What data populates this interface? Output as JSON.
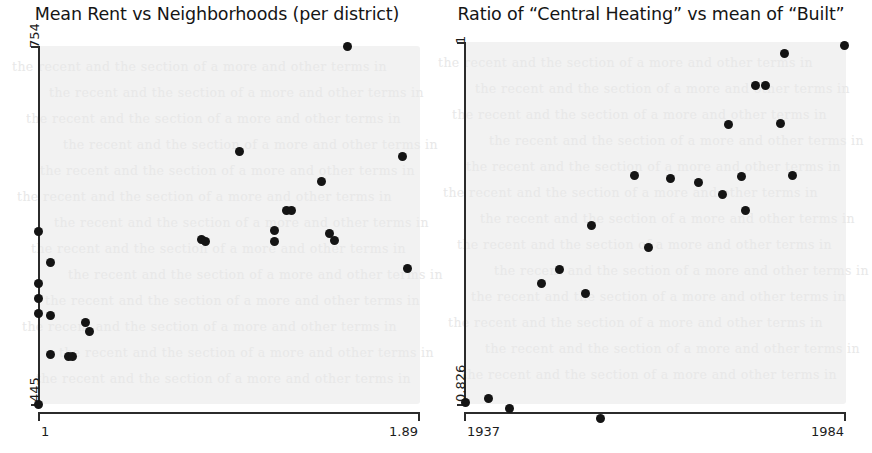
{
  "figure": {
    "background_color": "#ffffff",
    "plot_background_color": "#f2f2f2",
    "marker_color": "#141414",
    "axis_color": "#2b2b2b"
  },
  "panels": [
    {
      "id": "left",
      "title": "Mean Rent vs Neighborhoods (per district)",
      "x_min_label": "1",
      "x_max_label": "1.89",
      "y_min_label": "445",
      "y_max_label": "754"
    },
    {
      "id": "right",
      "title": "Ratio of “Central Heating” vs mean of “Built”",
      "x_min_label": "1937",
      "x_max_label": "1984",
      "y_min_label": "0.826",
      "y_max_label": "1"
    }
  ],
  "chart_data": [
    {
      "type": "scatter",
      "title": "Mean Rent vs Neighborhoods (per district)",
      "xlabel": "Neighborhoods (per district)",
      "ylabel": "Mean Rent",
      "xlim": [
        1,
        1.89
      ],
      "ylim": [
        445,
        754
      ],
      "xticks": [
        1,
        1.89
      ],
      "xticklabels": [
        "1",
        "1.89"
      ],
      "yticks": [
        445,
        754
      ],
      "yticklabels": [
        "445",
        "754"
      ],
      "grid": false,
      "legend": false,
      "points": [
        {
          "x": 1.0,
          "y": 445
        },
        {
          "x": 1.0,
          "y": 594
        },
        {
          "x": 1.0,
          "y": 549
        },
        {
          "x": 1.0,
          "y": 536
        },
        {
          "x": 1.0,
          "y": 523
        },
        {
          "x": 1.03,
          "y": 567
        },
        {
          "x": 1.03,
          "y": 521
        },
        {
          "x": 1.03,
          "y": 488
        },
        {
          "x": 1.07,
          "y": 486
        },
        {
          "x": 1.08,
          "y": 486
        },
        {
          "x": 1.11,
          "y": 515
        },
        {
          "x": 1.12,
          "y": 508
        },
        {
          "x": 1.38,
          "y": 587
        },
        {
          "x": 1.39,
          "y": 585
        },
        {
          "x": 1.47,
          "y": 663
        },
        {
          "x": 1.55,
          "y": 595
        },
        {
          "x": 1.55,
          "y": 585
        },
        {
          "x": 1.58,
          "y": 612
        },
        {
          "x": 1.59,
          "y": 612
        },
        {
          "x": 1.66,
          "y": 637
        },
        {
          "x": 1.68,
          "y": 592
        },
        {
          "x": 1.69,
          "y": 586
        },
        {
          "x": 1.72,
          "y": 754
        },
        {
          "x": 1.85,
          "y": 659
        },
        {
          "x": 1.86,
          "y": 562
        }
      ]
    },
    {
      "type": "scatter",
      "title": "Ratio of “Central Heating” vs mean of “Built”",
      "xlabel": "mean of “Built”",
      "ylabel": "Ratio of “Central Heating”",
      "xlim": [
        1937,
        1984
      ],
      "ylim": [
        0.826,
        1.0
      ],
      "xticks": [
        1937,
        1984
      ],
      "xticklabels": [
        "1937",
        "1984"
      ],
      "yticks": [
        0.826,
        1.0
      ],
      "yticklabels": [
        "0.826",
        "1"
      ],
      "grid": false,
      "legend": false,
      "points": [
        {
          "x": 1937.2,
          "y": 0.8265
        },
        {
          "x": 1940.0,
          "y": 0.8285
        },
        {
          "x": 1942.6,
          "y": 0.824
        },
        {
          "x": 1946.5,
          "y": 0.884
        },
        {
          "x": 1948.8,
          "y": 0.8905
        },
        {
          "x": 1952.0,
          "y": 0.879
        },
        {
          "x": 1952.7,
          "y": 0.912
        },
        {
          "x": 1953.8,
          "y": 0.819
        },
        {
          "x": 1958.0,
          "y": 0.936
        },
        {
          "x": 1959.7,
          "y": 0.901
        },
        {
          "x": 1962.4,
          "y": 0.9345
        },
        {
          "x": 1965.9,
          "y": 0.9325
        },
        {
          "x": 1968.8,
          "y": 0.9265
        },
        {
          "x": 1969.6,
          "y": 0.9605
        },
        {
          "x": 1971.2,
          "y": 0.9355
        },
        {
          "x": 1971.6,
          "y": 0.919
        },
        {
          "x": 1972.9,
          "y": 0.979
        },
        {
          "x": 1974.1,
          "y": 0.979
        },
        {
          "x": 1975.9,
          "y": 0.961
        },
        {
          "x": 1976.4,
          "y": 0.9945
        },
        {
          "x": 1977.4,
          "y": 0.936
        },
        {
          "x": 1983.8,
          "y": 0.9985
        }
      ]
    }
  ],
  "watermark": {
    "visible": true,
    "note": "faint background page text bleed-through"
  }
}
